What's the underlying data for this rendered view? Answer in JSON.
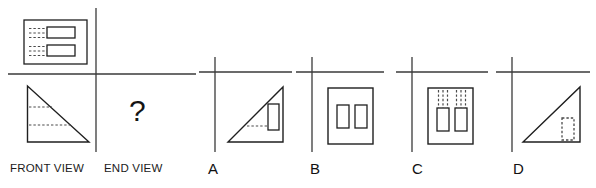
{
  "question": {
    "type": "orthographic-projection-multiple-choice",
    "prompt_symbol": "?",
    "captions": {
      "front_view": "FRONT VIEW",
      "end_view": "END VIEW"
    },
    "options": [
      {
        "letter": "A",
        "description": "right triangle, right angle bottom-right, hypotenuse rising left-to-right, one solid rectangle near right edge with hidden dashed line to its left"
      },
      {
        "letter": "B",
        "description": "upright rectangle containing two small solid rectangles side by side"
      },
      {
        "letter": "C",
        "description": "upright rectangle containing two small solid rectangles with dashed hidden lines extending upward"
      },
      {
        "letter": "D",
        "description": "right triangle, right angle bottom-right, hypotenuse rising left-to-right, one dashed hidden rectangle near bottom-right"
      }
    ]
  },
  "given_views": {
    "plan": {
      "name": "plan-view",
      "outline": "horizontal rectangle",
      "features": 2,
      "feature_shape": "small solid rectangle with dashed hidden lines extending left",
      "x": 24,
      "y": 20,
      "width": 63,
      "height": 44
    },
    "front": {
      "name": "front-view",
      "outline": "right triangle, right angle bottom-left, hypotenuse falling left-to-right",
      "hidden_lines": 2,
      "x": 27,
      "y": 86,
      "width": 62,
      "height": 56
    }
  },
  "colors": {
    "line": "#3a3a3a",
    "object_line": "#1f1f1f",
    "hidden_line": "#4a4a4a",
    "text": "#141414",
    "background": "#ffffff"
  },
  "axes": {
    "given_panel": {
      "vertical_x": 96,
      "horizontal_y": 74
    },
    "option_a": {
      "vertical_x": 215,
      "horizontal_y": 72
    },
    "option_b": {
      "vertical_x": 312,
      "horizontal_y": 72
    },
    "option_c": {
      "vertical_x": 412,
      "horizontal_y": 72
    },
    "option_d": {
      "vertical_x": 512,
      "horizontal_y": 72
    }
  }
}
